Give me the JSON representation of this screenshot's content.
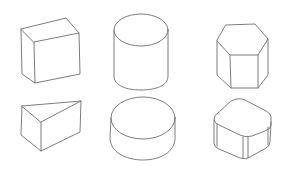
{
  "figure": {
    "title": "Hand-drawn 3D primitive shapes",
    "background": "#ffffff",
    "stroke_color": "#6e6e6e",
    "layout": {
      "rows": 2,
      "columns": 3
    },
    "shapes": [
      {
        "name": "cube",
        "row": 1,
        "column": 1
      },
      {
        "name": "cylinder",
        "row": 1,
        "column": 2
      },
      {
        "name": "hexagonal-prism",
        "row": 1,
        "column": 3
      },
      {
        "name": "triangular-prism",
        "row": 2,
        "column": 1
      },
      {
        "name": "short-cylinder",
        "row": 2,
        "column": 2
      },
      {
        "name": "rounded-cube",
        "row": 2,
        "column": 3
      }
    ]
  }
}
